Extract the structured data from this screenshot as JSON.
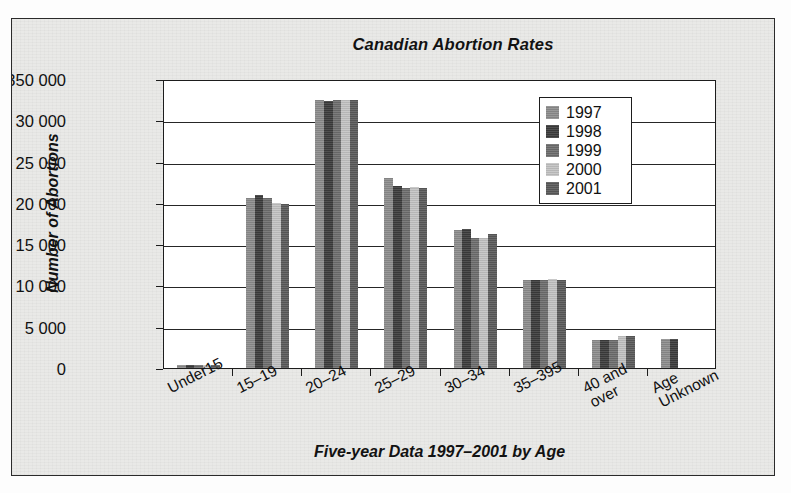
{
  "chart_data": {
    "type": "bar",
    "title": "Canadian Abortion Rates",
    "xlabel": "Five-year Data 1997–2001 by Age",
    "ylabel": "Number of Abortions",
    "categories": [
      "Under15",
      "15–19",
      "20–24",
      "25–29",
      "30–34",
      "35–395",
      "40 and\nover",
      "Age\nUnknown"
    ],
    "category_labels_flat": [
      "Under15",
      "15–19",
      "20–24",
      "25–29",
      "30–34",
      "35–395",
      "40 and over",
      "Age Unknown"
    ],
    "ytick_labels": [
      "350 000",
      "30 000",
      "25 000",
      "20 000",
      "15 000",
      "10 000",
      "5 000",
      "0"
    ],
    "ytick_values": [
      35000,
      30000,
      25000,
      20000,
      15000,
      10000,
      5000,
      0
    ],
    "ylim": [
      0,
      35000
    ],
    "grid": true,
    "legend_position": "inside-top-right",
    "series": [
      {
        "name": "1997",
        "color": "#8d8d8d",
        "values": [
          380,
          20600,
          32500,
          23000,
          16700,
          10600,
          3400,
          3500
        ]
      },
      {
        "name": "1998",
        "color": "#3c3c3c",
        "values": [
          400,
          20900,
          32300,
          22000,
          16800,
          10700,
          3400,
          3500
        ]
      },
      {
        "name": "1999",
        "color": "#6e6e6e",
        "values": [
          370,
          20600,
          32500,
          21800,
          15800,
          10600,
          3400,
          0
        ]
      },
      {
        "name": "2000",
        "color": "#c3c3c3",
        "values": [
          330,
          20000,
          32500,
          21900,
          15700,
          10800,
          3900,
          0
        ]
      },
      {
        "name": "2001",
        "color": "#5a5a5a",
        "values": [
          330,
          19900,
          32500,
          21800,
          16200,
          10700,
          3900,
          0
        ]
      }
    ]
  },
  "legend": {
    "items": [
      {
        "label": "1997"
      },
      {
        "label": "1998"
      },
      {
        "label": "1999"
      },
      {
        "label": "2000"
      },
      {
        "label": "2001"
      }
    ]
  }
}
